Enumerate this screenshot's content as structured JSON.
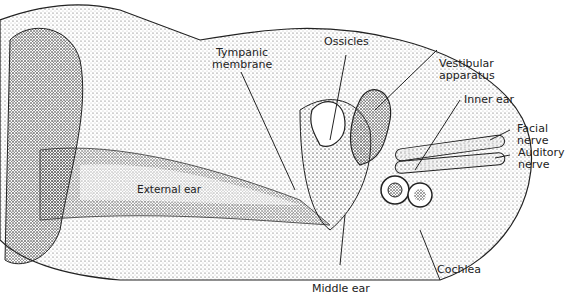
{
  "diagram": {
    "labels": {
      "tympanic_membrane_1": "Tympanic",
      "tympanic_membrane_2": "membrane",
      "ossicles": "Ossicles",
      "vestibular_1": "Vestibular",
      "vestibular_2": "apparatus",
      "inner_ear": "Inner ear",
      "facial_1": "Facial",
      "facial_2": "nerve",
      "auditory_1": "Auditory",
      "auditory_2": "nerve",
      "external_ear": "External ear",
      "middle_ear": "Middle ear",
      "cochlea": "Cochlea"
    },
    "colors": {
      "ink": "#222222",
      "stipple": "#888888",
      "background": "#ffffff"
    }
  }
}
